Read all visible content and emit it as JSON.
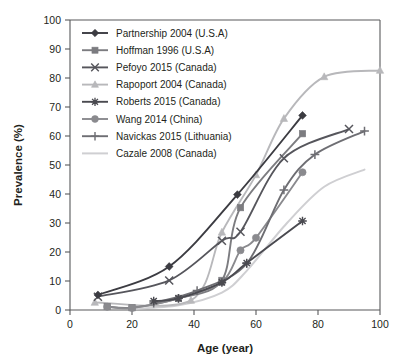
{
  "chart_data": {
    "type": "line",
    "title": "",
    "xlabel": "Age (year)",
    "ylabel": "Prevalence (%)",
    "xlim": [
      0,
      100
    ],
    "ylim": [
      0,
      100
    ],
    "xticks": [
      0,
      20,
      40,
      60,
      80,
      100
    ],
    "yticks": [
      0,
      10,
      20,
      30,
      40,
      50,
      60,
      70,
      80,
      90,
      100
    ],
    "grid": false,
    "legend_position": "top-left",
    "series": [
      {
        "name": "Partnership 2004 (U.S.A)",
        "label": "Partnership 2004 (U.S.A)",
        "color": "#3c3c42",
        "marker": "diamond",
        "x": [
          9,
          32,
          54,
          75
        ],
        "y": [
          5.2,
          15.0,
          39.8,
          67.1
        ]
      },
      {
        "name": "Hoffman 1996 (U.S.A)",
        "label": "Hoffman 1996 (U.S.A)",
        "color": "#7c7c80",
        "marker": "square",
        "x": [
          12,
          20,
          35,
          49,
          55,
          75
        ],
        "y": [
          1.2,
          0.8,
          4.0,
          10.2,
          35.3,
          60.8
        ]
      },
      {
        "name": "Pefoyo 2015 (Canada)",
        "label": "Pefoyo 2015 (Canada)",
        "color": "#56565c",
        "marker": "x-cross",
        "x": [
          9,
          32,
          49,
          55,
          69,
          90
        ],
        "y": [
          4.6,
          10.2,
          23.9,
          27.0,
          52.3,
          62.4
        ]
      },
      {
        "name": "Rapoport 2004 (Canada)",
        "label": "Rapoport 2004 (Canada)",
        "color": "#b8b8bb",
        "marker": "triangle",
        "x": [
          8,
          39,
          49,
          60,
          69,
          82,
          100
        ],
        "y": [
          2.6,
          3.3,
          26.8,
          46.6,
          66.0,
          80.4,
          82.6
        ]
      },
      {
        "name": "Roberts 2015 (Canada)",
        "label": "Roberts 2015 (Canada)",
        "color": "#4a4a50",
        "marker": "asterisk",
        "x": [
          27,
          35,
          49,
          57,
          75
        ],
        "y": [
          3.1,
          4.0,
          9.5,
          16.2,
          30.7
        ]
      },
      {
        "name": "Wang 2014 (China)",
        "label": "Wang 2014 (China)",
        "color": "#8a8a8e",
        "marker": "circle",
        "x": [
          12,
          20,
          35,
          49,
          55,
          60,
          75
        ],
        "y": [
          1.1,
          0.7,
          4.0,
          9.6,
          20.6,
          24.9,
          47.5
        ]
      },
      {
        "name": "Navickas 2015 (Lithuania)",
        "label": "Navickas 2015 (Lithuania)",
        "color": "#6e6e73",
        "marker": "plus",
        "x": [
          27,
          41,
          57,
          69,
          79,
          95
        ],
        "y": [
          2.4,
          6.7,
          16.0,
          41.4,
          53.6,
          61.7
        ]
      },
      {
        "name": "Cazale 2008 (Canada)",
        "label": "Cazale 2008 (Canada)",
        "color": "#cfcfd2",
        "marker": "none",
        "x": [
          20,
          35,
          49,
          57,
          70,
          82,
          95
        ],
        "y": [
          0.4,
          1.6,
          6.0,
          13.5,
          30.0,
          42.5,
          48.4
        ]
      }
    ]
  },
  "axes": {
    "x_title": "Age (year)",
    "y_title": "Prevalence (%)",
    "x_tick_labels": [
      "0",
      "20",
      "40",
      "60",
      "80",
      "100"
    ],
    "y_tick_labels": [
      "0",
      "10",
      "20",
      "30",
      "40",
      "50",
      "60",
      "70",
      "80",
      "90",
      "100"
    ]
  },
  "legend": {
    "items": [
      {
        "label": "Partnership 2004 (U.S.A)"
      },
      {
        "label": "Hoffman 1996 (U.S.A)"
      },
      {
        "label": "Pefoyo 2015 (Canada)"
      },
      {
        "label": "Rapoport 2004 (Canada)"
      },
      {
        "label": "Roberts 2015 (Canada)"
      },
      {
        "label": "Wang 2014 (China)"
      },
      {
        "label": "Navickas 2015 (Lithuania)"
      },
      {
        "label": "Cazale 2008 (Canada)"
      }
    ]
  },
  "colors": {
    "axis": "#58595b",
    "text": "#231f20",
    "background": "#ffffff"
  }
}
